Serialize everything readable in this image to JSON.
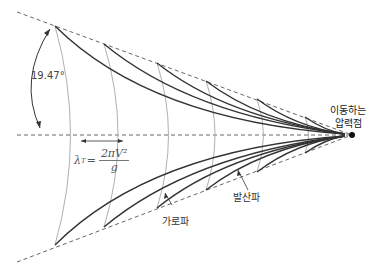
{
  "diagram": {
    "angle_label": "19.47°",
    "wavelength_formula": {
      "lhs": "λ",
      "lhs_sub": "T",
      "eq": "=",
      "numerator": "2πV²",
      "denominator": "g"
    },
    "labels": {
      "pressure_point": [
        "이동하는",
        "압력점"
      ],
      "transverse_wave": "가로파",
      "divergent_wave": "발산파"
    },
    "colors": {
      "divergent_wave": "#333333",
      "transverse_wave": "#aaaaaa",
      "boundary_dashed": "#666666",
      "text": "#333333"
    }
  }
}
